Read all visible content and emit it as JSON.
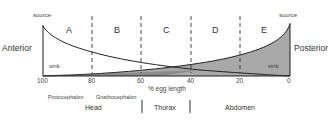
{
  "diagram": {
    "left_label": "Anterior",
    "right_label": "Posterior",
    "source_left": "source",
    "source_right": "source",
    "sink_left": "sink",
    "sink_right": "sink",
    "regions": [
      "A",
      "B",
      "C",
      "D",
      "E"
    ],
    "x_ticks": [
      "100",
      "80",
      "60",
      "40",
      "20",
      "0"
    ],
    "x_axis_label": "% egg length",
    "subregions": [
      "Protocephalon",
      "Gnathocephalon"
    ],
    "segments": [
      "Head",
      "Thorax",
      "Abdomen"
    ],
    "colors": {
      "line": "#222222",
      "posterior_fill": "#a8a8a8",
      "dashed": "#333333"
    }
  }
}
